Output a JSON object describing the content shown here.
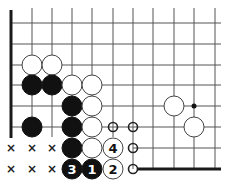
{
  "board": {
    "columns_x": [
      11,
      32,
      52,
      72,
      92,
      113,
      133,
      153,
      174,
      194,
      215
    ],
    "rows_y": [
      23,
      44,
      65,
      85,
      106,
      127,
      148,
      169
    ],
    "stone_radius": 10,
    "colors": {
      "black": "#111111",
      "white": "#ffffff",
      "line": "#555555"
    }
  },
  "stones": [
    {
      "color": "white",
      "col": 1,
      "row": 2,
      "label": ""
    },
    {
      "color": "white",
      "col": 2,
      "row": 2,
      "label": ""
    },
    {
      "color": "black",
      "col": 1,
      "row": 3,
      "label": ""
    },
    {
      "color": "black",
      "col": 2,
      "row": 3,
      "label": ""
    },
    {
      "color": "white",
      "col": 3,
      "row": 3,
      "label": ""
    },
    {
      "color": "white",
      "col": 4,
      "row": 3,
      "label": ""
    },
    {
      "color": "black",
      "col": 3,
      "row": 4,
      "label": ""
    },
    {
      "color": "white",
      "col": 4,
      "row": 4,
      "label": ""
    },
    {
      "color": "white",
      "col": 8,
      "row": 4,
      "label": ""
    },
    {
      "color": "black",
      "col": 1,
      "row": 5,
      "label": ""
    },
    {
      "color": "black",
      "col": 3,
      "row": 5,
      "label": ""
    },
    {
      "color": "white",
      "col": 4,
      "row": 5,
      "label": ""
    },
    {
      "color": "white",
      "col": 9,
      "row": 5,
      "label": ""
    },
    {
      "color": "black",
      "col": 3,
      "row": 6,
      "label": ""
    },
    {
      "color": "white",
      "col": 4,
      "row": 6,
      "label": ""
    },
    {
      "color": "white",
      "col": 5,
      "row": 6,
      "label": "4"
    },
    {
      "color": "black",
      "col": 3,
      "row": 7,
      "label": "3"
    },
    {
      "color": "black",
      "col": 4,
      "row": 7,
      "label": "1"
    },
    {
      "color": "white",
      "col": 5,
      "row": 7,
      "label": "2"
    }
  ],
  "marks": {
    "x": [
      {
        "col": 0,
        "row": 6
      },
      {
        "col": 1,
        "row": 6
      },
      {
        "col": 2,
        "row": 6
      },
      {
        "col": 0,
        "row": 7
      },
      {
        "col": 1,
        "row": 7
      },
      {
        "col": 2,
        "row": 7
      }
    ],
    "x_glyph": "×",
    "circle": [
      {
        "col": 5,
        "row": 5
      },
      {
        "col": 6,
        "row": 5
      },
      {
        "col": 6,
        "row": 6
      },
      {
        "col": 6,
        "row": 7
      }
    ],
    "star_points": [
      {
        "col": 9,
        "row": 4
      }
    ]
  }
}
